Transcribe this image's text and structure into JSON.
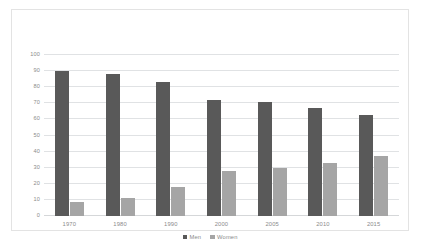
{
  "chart_data": {
    "type": "bar",
    "title": "",
    "subtitle": "",
    "xlabel": "",
    "ylabel": "",
    "categories": [
      "1970",
      "1980",
      "1990",
      "2000",
      "2005",
      "2010",
      "2015"
    ],
    "series": [
      {
        "name": "Men",
        "color": "#595959",
        "values": [
          90,
          88,
          83,
          72,
          71,
          67,
          63
        ]
      },
      {
        "name": "Women",
        "color": "#a5a5a5",
        "values": [
          9,
          11,
          18,
          28,
          30,
          33,
          37
        ]
      }
    ],
    "ylim": [
      0,
      100
    ],
    "ytick_step": 10,
    "yticks": [
      "0",
      "10",
      "20",
      "30",
      "40",
      "50",
      "60",
      "70",
      "80",
      "90",
      "100"
    ],
    "grid": true,
    "grid_axis": "y",
    "legend": true,
    "legend_position": "bottom",
    "legend_entries": [
      "Men",
      "Women"
    ],
    "annotations": []
  },
  "colors": {
    "men": "#595959",
    "women": "#a5a5a5",
    "gridline": "#e0e2e4",
    "frame_border": "#e3e3e3",
    "tick_text": "#8b8b8b",
    "background": "#ffffff"
  }
}
